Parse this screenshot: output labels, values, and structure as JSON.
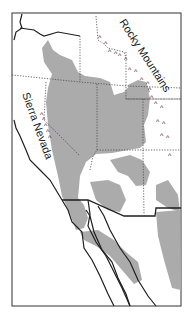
{
  "map": {
    "labels": {
      "rocky": "Rocky Mountains",
      "sierra": "Sierra Nevada"
    },
    "colors": {
      "shaded_region": "#ababab",
      "outline": "#1e1e1e",
      "state_border": "#444444",
      "background": "#ffffff"
    },
    "mountain_symbol": "^"
  }
}
